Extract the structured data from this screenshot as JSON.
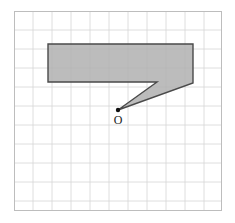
{
  "figure": {
    "header_text": "· · ·  · · ···",
    "title": "",
    "background_color": "#ffffff"
  },
  "grid": {
    "name": "square-grid",
    "origin_x_px": 14,
    "origin_y_px": 11,
    "cell_size_px": 19,
    "columns": 11,
    "rows": 10,
    "width_px": 208,
    "height_px": 200,
    "line_color": "#d6d6d6",
    "border_color": "#bdbdbd"
  },
  "shape": {
    "name": "seven-shaped-polygon",
    "label": "",
    "fill_color": "#b0b0b0",
    "stroke_color": "#4a4a4a",
    "points_px": [
      [
        34,
        33
      ],
      [
        179,
        33
      ],
      [
        179,
        72
      ],
      [
        104,
        99
      ],
      [
        143,
        71
      ],
      [
        34,
        71
      ]
    ],
    "points_grid": [
      [
        1.8,
        1.7
      ],
      [
        9.4,
        1.7
      ],
      [
        9.4,
        3.8
      ],
      [
        5.5,
        5.2
      ],
      [
        7.5,
        3.7
      ],
      [
        1.8,
        3.7
      ]
    ]
  },
  "point": {
    "name": "marked-point",
    "label": "O",
    "x_px": 104,
    "y_px": 99,
    "label_x_px": 104,
    "label_y_px": 113,
    "dot_radius_px": 2.2,
    "color": "#111111"
  }
}
